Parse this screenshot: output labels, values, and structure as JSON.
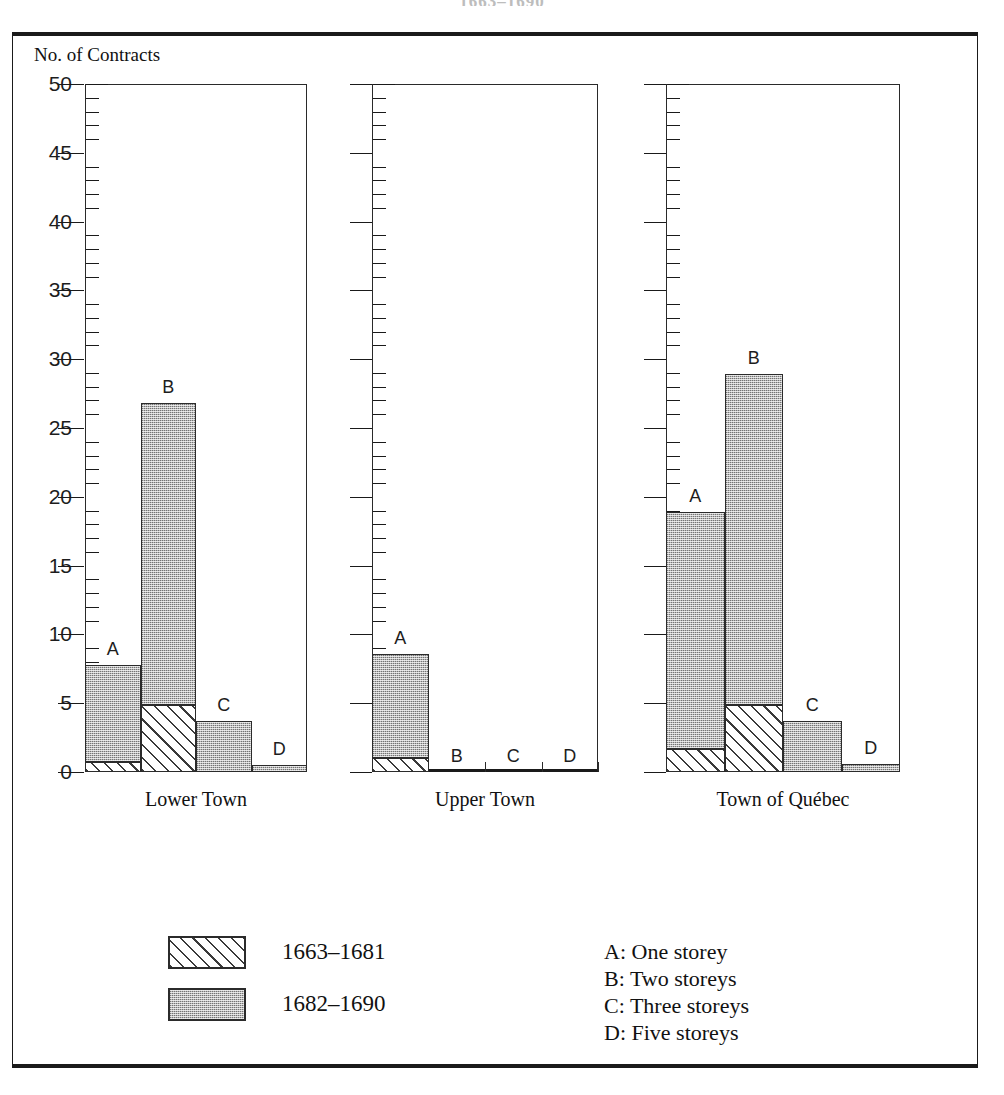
{
  "figure": {
    "cut_off_title": "1663–1690",
    "y_axis_title": "No. of Contracts"
  },
  "chart_data": {
    "type": "bar",
    "title": "No. of Contracts",
    "subtitle": "",
    "xlabel": "",
    "ylabel": "No. of Contracts",
    "ylim": [
      0,
      50
    ],
    "y_major_step": 5,
    "y_minor_step": 1,
    "grid": false,
    "stacked": true,
    "legend_position": "bottom-left",
    "y_tick_labels": [
      "0",
      "5",
      "10",
      "15",
      "20",
      "25",
      "30",
      "35",
      "40",
      "45",
      "50"
    ],
    "panels": [
      "Lower Town",
      "Upper Town",
      "Town of Québec"
    ],
    "categories": [
      "A",
      "B",
      "C",
      "D"
    ],
    "category_key": [
      "A: One storey",
      "B: Two storeys",
      "C: Three storeys",
      "D: Five storeys"
    ],
    "series": [
      {
        "name": "1663–1681",
        "pattern": "diagonal-hatch",
        "color": "#ffffff"
      },
      {
        "name": "1682–1690",
        "pattern": "stipple-gray",
        "color": "#b9b9b9"
      }
    ],
    "values": {
      "Lower Town": {
        "1663–1681": [
          0.7,
          4.9,
          0.0,
          0.0
        ],
        "1682–1690": [
          7.1,
          21.9,
          3.7,
          0.5
        ]
      },
      "Upper Town": {
        "1663–1681": [
          1.0,
          0.0,
          0.0,
          0.0
        ],
        "1682–1690": [
          7.6,
          0.0,
          0.0,
          0.0
        ]
      },
      "Town of Québec": {
        "1663–1681": [
          1.7,
          4.9,
          0.0,
          0.0
        ],
        "1682–1690": [
          17.2,
          24.0,
          3.7,
          0.6
        ]
      }
    },
    "totals": {
      "Lower Town": [
        7.8,
        26.8,
        3.7,
        0.5
      ],
      "Upper Town": [
        8.6,
        0.0,
        0.0,
        0.0
      ],
      "Town of Québec": [
        18.9,
        28.9,
        3.7,
        0.6
      ]
    }
  },
  "panels": [
    {
      "id": "lower-town",
      "label": "Lower Town"
    },
    {
      "id": "upper-town",
      "label": "Upper Town"
    },
    {
      "id": "town-of-quebec",
      "label": "Town of Québec"
    }
  ],
  "legend": {
    "swatches": [
      {
        "label": "1663–1681",
        "pattern": "hatch"
      },
      {
        "label": "1682–1690",
        "pattern": "stipple"
      }
    ],
    "keys": [
      "A: One storey",
      "B: Two storeys",
      "C: Three storeys",
      "D: Five storeys"
    ]
  },
  "bar_letters": [
    "A",
    "B",
    "C",
    "D"
  ]
}
